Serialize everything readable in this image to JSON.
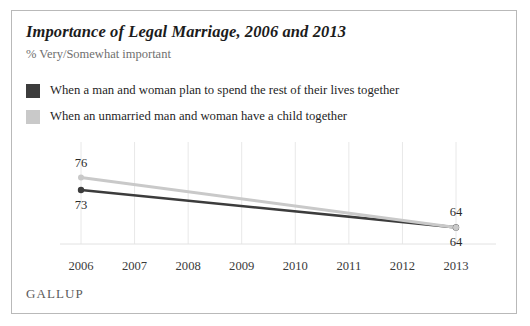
{
  "card": {
    "title": "Importance of Legal Marriage, 2006 and 2013",
    "subtitle": "% Very/Somewhat important",
    "source_logo": "GALLUP"
  },
  "legend": {
    "position": "top-left",
    "items": [
      {
        "label": "When a man and woman plan to spend the rest of their lives together",
        "color": "#3c3c3c",
        "swatch": "legend-swatch-dark"
      },
      {
        "label": "When an unmarried man and woman have a child together",
        "color": "#c9c9c9",
        "swatch": "legend-swatch-light"
      }
    ]
  },
  "chart_data": {
    "type": "line",
    "title": "Importance of Legal Marriage, 2006 and 2013",
    "subtitle": "% Very/Somewhat important",
    "xlabel": "",
    "ylabel": "",
    "categories": [
      "2006",
      "2007",
      "2008",
      "2009",
      "2010",
      "2011",
      "2012",
      "2013"
    ],
    "x": [
      2006,
      2007,
      2008,
      2009,
      2010,
      2011,
      2012,
      2013
    ],
    "ylim": [
      60,
      80
    ],
    "grid": "vertical",
    "series": [
      {
        "name": "When a man and woman plan to spend the rest of their lives together",
        "color": "#3c3c3c",
        "endpoints_only": true,
        "values": [
          73,
          null,
          null,
          null,
          null,
          null,
          null,
          64
        ],
        "labels": [
          {
            "category": "2006",
            "value": 73,
            "text": "73",
            "placement": "below"
          },
          {
            "category": "2013",
            "value": 64,
            "text": "64",
            "placement": "below"
          }
        ]
      },
      {
        "name": "When an unmarried man and woman have a child together",
        "color": "#c9c9c9",
        "endpoints_only": true,
        "values": [
          76,
          null,
          null,
          null,
          null,
          null,
          null,
          64
        ],
        "labels": [
          {
            "category": "2006",
            "value": 76,
            "text": "76",
            "placement": "above"
          },
          {
            "category": "2013",
            "value": 64,
            "text": "64",
            "placement": "above"
          }
        ]
      }
    ]
  },
  "axis": {
    "tick_labels": [
      "2006",
      "2007",
      "2008",
      "2009",
      "2010",
      "2011",
      "2012",
      "2013"
    ]
  },
  "value_labels": {
    "left_top": "76",
    "left_bottom": "73",
    "right_top": "64",
    "right_bottom": "64"
  },
  "colors": {
    "series_dark": "#3c3c3c",
    "series_light": "#c9c9c9",
    "gridline": "#e8e8e8",
    "baseline": "#e2e2e2",
    "border": "#b9b9b9",
    "title": "#1c1c1c",
    "subtitle": "#6f6f6f"
  }
}
